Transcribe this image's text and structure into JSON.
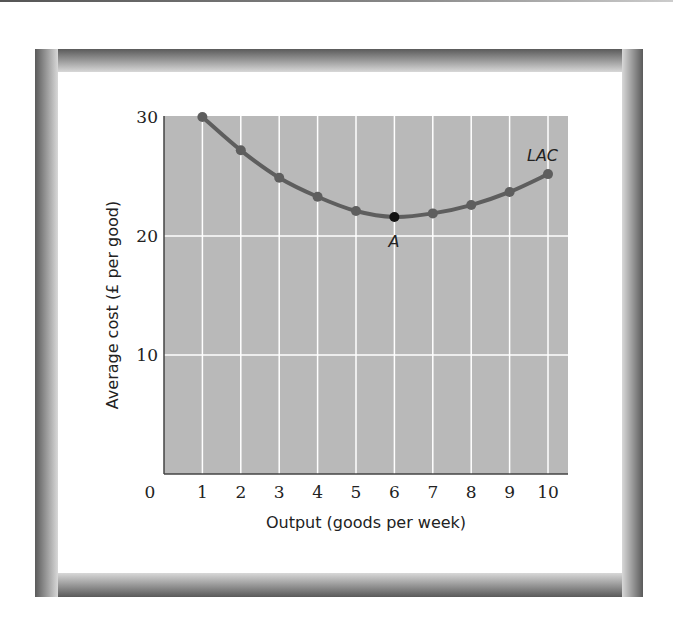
{
  "figure": {
    "background": "#ffffff",
    "frame_color": "#5a5a5a",
    "plot_background": "#b9b9b9",
    "grid_color": "#ffffff",
    "curve_color": "#5e5e5e",
    "highlight_point_color": "#111111"
  },
  "chart_data": {
    "type": "line",
    "title": "",
    "xlabel": "Output (goods per week)",
    "ylabel": "Average cost (£ per good)",
    "x": [
      1,
      2,
      3,
      4,
      5,
      6,
      7,
      8,
      9,
      10
    ],
    "series": [
      {
        "name": "LAC",
        "values": [
          30,
          27.2,
          24.9,
          23.3,
          22.1,
          21.6,
          21.9,
          22.6,
          23.7,
          25.2
        ]
      }
    ],
    "xlim": [
      0,
      10.5
    ],
    "ylim": [
      0,
      30
    ],
    "x_ticks": [
      "0",
      "1",
      "2",
      "3",
      "4",
      "5",
      "6",
      "7",
      "8",
      "9",
      "10"
    ],
    "y_ticks": [
      "10",
      "20",
      "30"
    ],
    "grid": true,
    "legend": "none",
    "annotations": [
      {
        "text": "LAC",
        "x": 10,
        "y": 25.2,
        "position": "above-left",
        "style": "italic"
      },
      {
        "text": "A",
        "x": 6,
        "y": 21.6,
        "position": "below",
        "style": "italic",
        "marker": "highlighted minimum point"
      }
    ]
  }
}
